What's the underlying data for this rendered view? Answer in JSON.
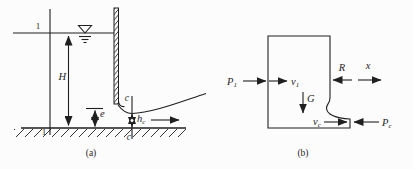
{
  "colors": {
    "ink": "#1f1f1f",
    "background": "#fcfcfc"
  },
  "diagram_a": {
    "caption": "(a)",
    "section_1_top": "1",
    "section_1_bottom": "1",
    "upstream_depth": "H",
    "gate_opening": "e",
    "section_c_top": "c",
    "section_c_bottom": "c",
    "contracted_depth": {
      "base": "h",
      "sub": "c"
    }
  },
  "diagram_b": {
    "caption": "(b)",
    "inlet_pressure": {
      "base": "P",
      "sub": "1"
    },
    "inlet_velocity": {
      "base": "v",
      "sub": "1"
    },
    "weight": "G",
    "gate_reaction": "R",
    "axis": "x",
    "outlet_velocity": {
      "base": "v",
      "sub": "c"
    },
    "outlet_pressure": {
      "base": "P",
      "sub": "c"
    }
  }
}
